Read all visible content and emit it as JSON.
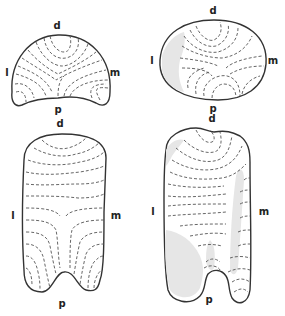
{
  "figure": {
    "panels": [
      {
        "id": "top-left",
        "labels": {
          "top": "d",
          "left": "l",
          "right": "m",
          "bottom": "p"
        },
        "shape": "kidney/mushroom cross-section",
        "shaded": false
      },
      {
        "id": "top-right",
        "labels": {
          "top": "d",
          "left": "l",
          "right": "m",
          "bottom": "p"
        },
        "shape": "oval cross-section",
        "shaded": true
      },
      {
        "id": "bottom-left",
        "labels": {
          "top": "d",
          "left": "l",
          "right": "m",
          "bottom": "p"
        },
        "shape": "elongated notched outline",
        "shaded": false
      },
      {
        "id": "bottom-right",
        "labels": {
          "top": "d",
          "left": "l",
          "right": "m",
          "bottom": "p"
        },
        "shape": "elongated notched outline",
        "shaded": true
      }
    ],
    "colors": {
      "outline": "#333333",
      "dashed_lines": "#555555",
      "shading": "#e6e6e6",
      "background": "#ffffff"
    }
  }
}
